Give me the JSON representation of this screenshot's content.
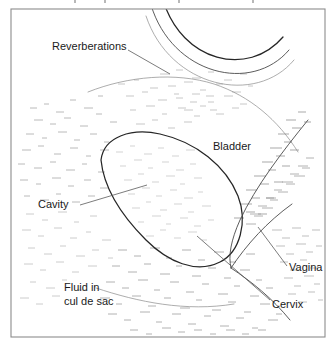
{
  "figure": {
    "kind": "ultrasound-line-drawing",
    "background_color": "#ffffff",
    "frame_color": "#8c8c8c",
    "ink_color": "#262626",
    "speckle_color": "#9a9a9a",
    "leader_color": "#5a5a5a"
  },
  "labels": [
    {
      "id": "reverberations",
      "text": "Reverberations",
      "x": 52,
      "y": 50,
      "anchor": "start",
      "has_leader": true
    },
    {
      "id": "bladder",
      "text": "Bladder",
      "x": 213,
      "y": 150,
      "anchor": "start",
      "has_leader": false
    },
    {
      "id": "cavity",
      "text": "Cavity",
      "x": 38,
      "y": 208,
      "anchor": "start",
      "has_leader": true
    },
    {
      "id": "fluid-in-cul-de-sac",
      "line1": "Fluid in",
      "line2": "cul de sac",
      "x": 64,
      "y": 291,
      "anchor": "start",
      "has_leader": false
    },
    {
      "id": "vagina",
      "text": "Vagina",
      "x": 289,
      "y": 271,
      "anchor": "start",
      "has_leader": true
    },
    {
      "id": "cervix",
      "text": "Cervix",
      "x": 272,
      "y": 308,
      "anchor": "start",
      "has_leader": true
    }
  ],
  "anatomy": {
    "reverberation_arc_outer": "M 163 0 C 182 62 248 78 283 37",
    "reverberation_arc_inner": "M 151 5 C 172 75 252 94 289 50",
    "reverberation_arc_faint": "M 146 14 C 168 84 254 103 293 58",
    "bladder_upper_boundary": "M 88 90 C 128 74 176 70 214 82 C 250 94 276 118 296 150",
    "uterus_outline": "M 101 160 C 104 136 132 128 160 134 C 196 142 226 166 238 196 C 248 222 240 252 220 262 C 196 274 168 262 146 240 C 122 216 104 190 101 160 Z",
    "bladder_right_wall": "M 300 126 C 276 156 252 188 236 222 C 228 240 226 254 230 266",
    "cervix_canal": "M 232 268 C 248 244 268 222 292 206",
    "vagina_wall": "M 232 268 C 252 280 272 296 288 316",
    "cul_de_sac_floor": "M 96 286 C 136 300 184 310 232 304"
  },
  "leaders": {
    "reverberations": "M 128 52 L 168 72",
    "cavity": "M 80 206 L 145 186",
    "vagina": "M 286 268 L 258 228",
    "cervix": "M 270 302 L 196 236"
  }
}
